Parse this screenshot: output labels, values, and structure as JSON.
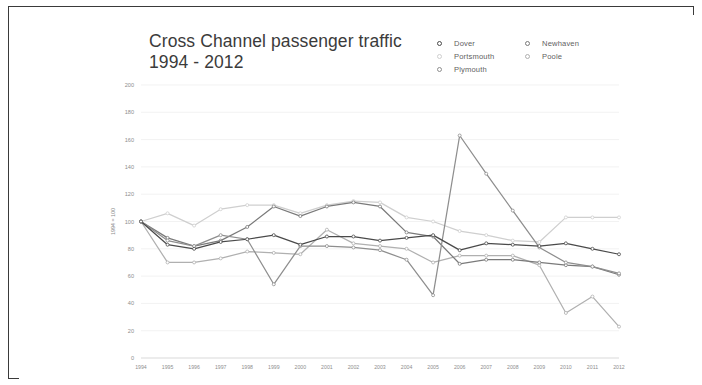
{
  "header": {
    "title_line1": "Cross Channel passenger traffic",
    "title_line2": "1994 - 2012"
  },
  "legend": {
    "column_a": [
      {
        "label": "Dover",
        "marker": "circle-marker-icon",
        "color": "#4a4a4a"
      },
      {
        "label": "Portsmouth",
        "marker": "circle-marker-icon",
        "color": "#cfcfcf"
      },
      {
        "label": "Plymouth",
        "marker": "circle-marker-icon",
        "color": "#8e8e8e"
      }
    ],
    "column_b": [
      {
        "label": "Newhaven",
        "marker": "circle-marker-icon",
        "color": "#7a7a7a"
      },
      {
        "label": "Poole",
        "marker": "circle-marker-icon",
        "color": "#b0b0b0"
      }
    ]
  },
  "chart_data": {
    "type": "line",
    "title": "Cross Channel passenger traffic 1994 - 2012",
    "xlabel": "",
    "ylabel": "1994 = 100",
    "ylim": [
      0,
      200
    ],
    "ytick_step": 20,
    "yticks": [
      0,
      20,
      40,
      60,
      80,
      100,
      120,
      140,
      160,
      180,
      200
    ],
    "grid": true,
    "legend_position": "top-right",
    "categories": [
      "1994",
      "1995",
      "1996",
      "1997",
      "1998",
      "1999",
      "2000",
      "2001",
      "2002",
      "2003",
      "2004",
      "2005",
      "2006",
      "2007",
      "2008",
      "2009",
      "2010",
      "2011",
      "2012"
    ],
    "series": [
      {
        "name": "Dover",
        "color": "#4a4a4a",
        "values": [
          100,
          83,
          80,
          85,
          87,
          90,
          83,
          89,
          89,
          86,
          88,
          90,
          79,
          84,
          83,
          82,
          84,
          80,
          76
        ]
      },
      {
        "name": "Portsmouth",
        "color": "#cfcfcf",
        "values": [
          100,
          106,
          97,
          109,
          112,
          112,
          106,
          112,
          115,
          114,
          103,
          100,
          93,
          90,
          86,
          85,
          103,
          103,
          103
        ]
      },
      {
        "name": "Plymouth",
        "color": "#8e8e8e",
        "values": [
          100,
          86,
          82,
          90,
          87,
          54,
          82,
          82,
          81,
          79,
          72,
          46,
          163,
          135,
          108,
          81,
          70,
          67,
          62
        ]
      },
      {
        "name": "Newhaven",
        "color": "#7a7a7a",
        "values": [
          100,
          88,
          82,
          86,
          96,
          111,
          104,
          111,
          114,
          111,
          92,
          89,
          69,
          72,
          72,
          70,
          68,
          67,
          61
        ]
      },
      {
        "name": "Poole",
        "color": "#b0b0b0",
        "values": [
          100,
          70,
          70,
          73,
          78,
          77,
          76,
          94,
          84,
          82,
          80,
          70,
          75,
          75,
          75,
          68,
          33,
          45,
          23
        ]
      }
    ]
  }
}
